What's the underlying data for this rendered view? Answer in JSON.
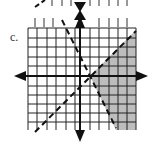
{
  "problem": {
    "label": "c.",
    "description": "Graph of a system of linear inequalities with two dashed boundary lines and shaded solution region"
  },
  "graph": {
    "grid": {
      "x_min": -5,
      "x_max": 6,
      "y_min": -5,
      "y_max": 5,
      "spacing_px": 9.5
    },
    "axes": {
      "origin_px": [
        80,
        76
      ],
      "x_arrows": true,
      "y_arrows": true
    },
    "lines": [
      {
        "name": "line-positive-slope",
        "style": "dashed",
        "slope": 1,
        "y_intercept": -1
      },
      {
        "name": "line-negative-slope",
        "style": "dashed",
        "slope": -2,
        "y_intercept": 2
      }
    ],
    "intersection": [
      1,
      0
    ],
    "shaded_region": "right of both lines (below positive-slope line, right of negative-slope line)",
    "colors": {
      "grid": "#222222",
      "shade": "#bdbdbd",
      "axis": "#111111",
      "line": "#111111"
    }
  }
}
